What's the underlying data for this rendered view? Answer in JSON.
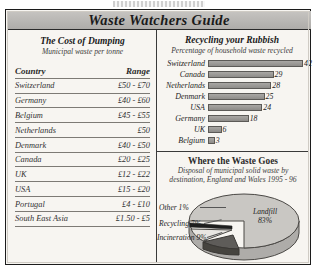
{
  "top_fragment": "",
  "banner": {
    "title": "Waste Watchers Guide"
  },
  "cost_panel": {
    "title": "The Cost of Dumping",
    "subtitle": "Municipal waste per tonne",
    "columns": [
      "Country",
      "Range"
    ],
    "rows": [
      {
        "country": "Switzerland",
        "range": "£50 - £70"
      },
      {
        "country": "Germany",
        "range": "£40 - £60"
      },
      {
        "country": "Belgium",
        "range": "£45 - £55"
      },
      {
        "country": "Netherlands",
        "range": "£50"
      },
      {
        "country": "Denmark",
        "range": "£40 - £50"
      },
      {
        "country": "Canada",
        "range": "£20 - £25"
      },
      {
        "country": "UK",
        "range": "£12 - £22"
      },
      {
        "country": "USA",
        "range": "£15 - £20"
      },
      {
        "country": "Portugal",
        "range": "£4 - £10"
      },
      {
        "country": "South East Asia",
        "range": "£1.50 - £5"
      }
    ]
  },
  "recycling_panel": {
    "title": "Recycling your Rubbish",
    "subtitle": "Percentage of household waste recycled"
  },
  "waste_panel": {
    "title": "Where the Waste Goes",
    "subtitle_line1": "Disposal of municipal solid waste by",
    "subtitle_line2": "destination, England and Wales 1995 - 96"
  },
  "colors": {
    "banner": "#bab8b5",
    "bar_fill": "#9b9996",
    "pie_landfill": "#c9c7c3",
    "pie_incineration": "#5e5c59",
    "pie_recycling": "#e8e6e2",
    "pie_other": "#1e1e1e",
    "frame": "#1c1c1c",
    "paper": "#f7f5f1"
  },
  "chart_data": [
    {
      "type": "bar",
      "orientation": "horizontal",
      "title": "Recycling your Rubbish",
      "subtitle": "Percentage of household waste recycled",
      "xlabel": "",
      "ylabel": "",
      "unit": "%",
      "categories": [
        "Switzerland",
        "Canada",
        "Netherlands",
        "Denmark",
        "USA",
        "Germany",
        "UK",
        "Belgium"
      ],
      "values": [
        42,
        29,
        28,
        25,
        24,
        18,
        6,
        3
      ],
      "value_labels": [
        "42",
        "29",
        "28",
        "25",
        "24",
        "18",
        "6",
        "3"
      ],
      "xlim": [
        0,
        42
      ],
      "grid": false,
      "legend": "none"
    },
    {
      "type": "pie",
      "title": "Where the Waste Goes",
      "subtitle": "Disposal of municipal solid waste by destination, England and Wales 1995 - 96",
      "style": "3d-exploded",
      "labels": [
        "Landfill",
        "Incineration",
        "Recycling",
        "Other"
      ],
      "values": [
        83,
        9,
        7,
        1
      ],
      "value_labels": [
        "83%",
        "9%",
        "7%",
        "1%"
      ],
      "display_labels": [
        "Landfill 83%",
        "Incineration 9%",
        "Recycling 7%",
        "Other 1%"
      ],
      "legend": "callout-labels"
    }
  ]
}
